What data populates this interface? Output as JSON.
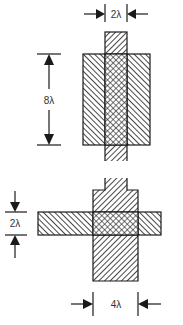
{
  "diagram": {
    "colors": {
      "stroke": "#1a1a1a",
      "background": "#ffffff",
      "label": "#333333"
    },
    "top_figure": {
      "description": "Vertical narrow strip (2λ wide) crossing a wide rectangle (8λ tall); overlap region cross-hatched",
      "dimension_width_label": "2λ",
      "dimension_height_label": "8λ"
    },
    "bottom_figure": {
      "description": "Horizontal bar (2λ tall) crossing a wide vertical rectangle (4λ wide) with narrow stem on top; overlap cross-hatched",
      "dimension_height_label": "2λ",
      "dimension_width_label": "4λ"
    },
    "icons": [
      "arrow-right-icon",
      "arrow-left-icon",
      "arrow-down-icon",
      "arrow-up-icon"
    ]
  }
}
